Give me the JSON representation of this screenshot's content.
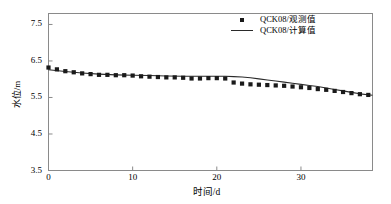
{
  "chart_data": {
    "type": "scatter",
    "title": "",
    "xlabel": "时间/d",
    "ylabel": "水位/m",
    "xlim": [
      0,
      38.5
    ],
    "ylim": [
      3.5,
      7.8
    ],
    "xticks": [
      0,
      10,
      20,
      30
    ],
    "yticks": [
      3.5,
      4.5,
      5.5,
      6.5,
      7.5
    ],
    "xtick_labels": [
      "0",
      "10",
      "20",
      "30"
    ],
    "ytick_labels": [
      "3.5",
      "4.5",
      "5.5",
      "6.5",
      "7.5"
    ],
    "grid": false,
    "legend_position": "top-right",
    "legend": [
      "QCK08/观测值",
      "QCK08/计算值"
    ],
    "series": [
      {
        "name": "QCK08/观测值",
        "type": "scatter",
        "marker": "square",
        "color": "#1a1a1a",
        "x": [
          0,
          1,
          2,
          3,
          4,
          5,
          6,
          7,
          8,
          9,
          10,
          11,
          12,
          13,
          14,
          15,
          16,
          17,
          18,
          19,
          20,
          21,
          22,
          23,
          24,
          25,
          26,
          27,
          28,
          29,
          30,
          31,
          32,
          33,
          34,
          35,
          36,
          37,
          38
        ],
        "values": [
          6.32,
          6.27,
          6.22,
          6.19,
          6.16,
          6.14,
          6.12,
          6.12,
          6.11,
          6.11,
          6.1,
          6.08,
          6.07,
          6.06,
          6.05,
          6.05,
          6.04,
          6.02,
          6.02,
          6.03,
          6.03,
          6.02,
          5.91,
          5.88,
          5.86,
          5.85,
          5.84,
          5.83,
          5.82,
          5.8,
          5.78,
          5.76,
          5.73,
          5.71,
          5.68,
          5.65,
          5.62,
          5.59,
          5.57
        ]
      },
      {
        "name": "QCK08/计算值",
        "type": "line",
        "color": "#2a2a2a",
        "x": [
          0,
          2,
          4,
          6,
          8,
          10,
          12,
          14,
          16,
          18,
          20,
          21,
          22,
          23,
          24,
          25,
          26,
          27,
          28,
          29,
          30,
          31,
          32,
          33,
          34,
          35,
          36,
          37,
          38.5
        ],
        "values": [
          6.26,
          6.21,
          6.17,
          6.14,
          6.12,
          6.11,
          6.1,
          6.09,
          6.08,
          6.08,
          6.08,
          6.08,
          6.07,
          6.06,
          6.04,
          6.01,
          5.98,
          5.95,
          5.92,
          5.89,
          5.86,
          5.83,
          5.8,
          5.76,
          5.72,
          5.68,
          5.64,
          5.6,
          5.56
        ]
      }
    ]
  },
  "axes": {
    "x_label": "时间/d",
    "y_label": "水位/m"
  }
}
